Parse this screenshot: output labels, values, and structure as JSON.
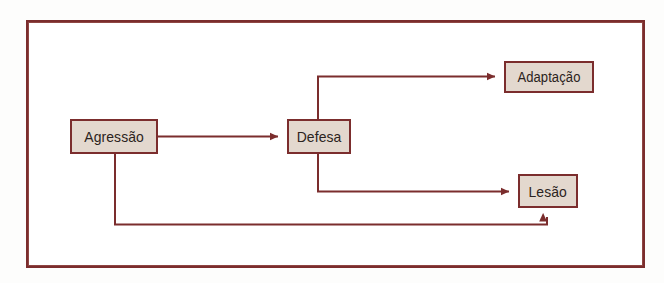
{
  "diagram": {
    "frame": {
      "border_color": "#7b2d2d",
      "background_color": "#ffffff"
    },
    "style": {
      "node_fill": "#e3d8ce",
      "node_border": "#7b2d2d",
      "connector_color": "#7b2d2d",
      "text_color": "#2b2320"
    },
    "nodes": [
      {
        "id": "agressao",
        "label": "Agressão"
      },
      {
        "id": "defesa",
        "label": "Defesa"
      },
      {
        "id": "adaptacao",
        "label": "Adaptação"
      },
      {
        "id": "lesao",
        "label": "Lesão"
      }
    ],
    "edges": [
      {
        "from": "agressao",
        "to": "defesa",
        "style": "straight",
        "arrowhead": "filled-triangle"
      },
      {
        "from": "defesa",
        "to": "adaptacao",
        "style": "orthogonal-up",
        "arrowhead": "filled-triangle"
      },
      {
        "from": "defesa",
        "to": "lesao",
        "style": "orthogonal-down",
        "arrowhead": "filled-triangle"
      },
      {
        "from": "agressao",
        "to": "lesao",
        "style": "orthogonal-bottom-loop",
        "arrowhead": "filled-triangle"
      }
    ]
  }
}
